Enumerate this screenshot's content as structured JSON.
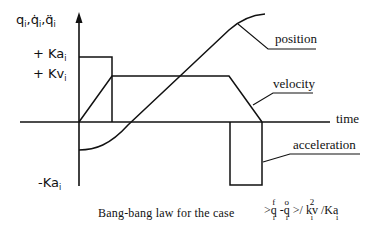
{
  "diagram": {
    "y_axis_label": "q_i, q̇_i, q̈_i",
    "y_axis_parts": [
      "q",
      "i",
      ",",
      "q̇",
      "i",
      ",",
      "q̈",
      "i"
    ],
    "ticks": {
      "plus_ka": {
        "prefix": "+",
        "sym": "Ka",
        "sub": "i"
      },
      "plus_kv": {
        "prefix": "+",
        "sym": "Kv",
        "sub": "i"
      },
      "minus_ka": {
        "prefix": "-",
        "sym": "Ka",
        "sub": "i"
      }
    },
    "x_axis_label": "time",
    "curve_labels": {
      "position": "position",
      "velocity": "velocity",
      "acceleration": "acceleration"
    },
    "caption": {
      "text": "Bang-bang law for the case",
      "condition": {
        "gt1": ">",
        "qf_top": "f",
        "qf_sym": "q",
        "qf_sub": "i",
        "minus": "-",
        "q0_top": "o",
        "q0_sym": "q",
        "q0_sub": "i",
        "gt2": ">/",
        "kv_top": "2",
        "kv_sym": "kv",
        "kv_sub": "i",
        "slash": "/Ka",
        "ka_sub": "i"
      }
    },
    "colors": {
      "line": "#111111",
      "background": "#ffffff"
    }
  }
}
